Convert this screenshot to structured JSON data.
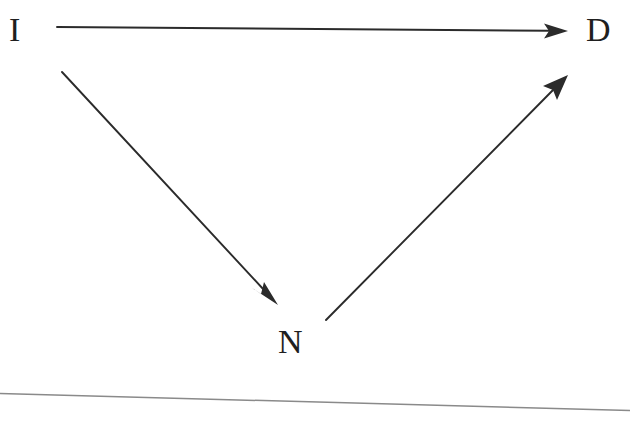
{
  "diagram": {
    "type": "causal-path-diagram",
    "background_color": "#ffffff",
    "stroke_color": "#2b2b2b",
    "rule_color": "#8a8a8a",
    "nodes": [
      {
        "id": "I",
        "label": "I",
        "x": 16,
        "y": 31
      },
      {
        "id": "D",
        "label": "D",
        "x": 601,
        "y": 31
      },
      {
        "id": "N",
        "label": "N",
        "x": 294,
        "y": 341
      }
    ],
    "edges": [
      {
        "id": "edge-i-to-d",
        "name": "arrow-i-to-d",
        "from": "I",
        "to": "D",
        "label": "",
        "arrowhead": "filled-triangle",
        "x1": 57,
        "y1": 27,
        "x2": 568,
        "y2": 31
      },
      {
        "id": "edge-i-to-n",
        "name": "arrow-i-to-n",
        "from": "I",
        "to": "N",
        "label": "",
        "arrowhead": "filled-triangle",
        "x1": 62,
        "y1": 72,
        "x2": 278,
        "y2": 305
      },
      {
        "id": "edge-n-to-d",
        "name": "arrow-n-to-d",
        "from": "N",
        "to": "D",
        "label": "",
        "arrowhead": "filled-triangle",
        "x1": 326,
        "y1": 320,
        "x2": 568,
        "y2": 75
      }
    ],
    "rule": {
      "name": "bottom-horizontal-rule",
      "x1": 0,
      "y1": 393,
      "x2": 630,
      "y2": 410
    }
  }
}
